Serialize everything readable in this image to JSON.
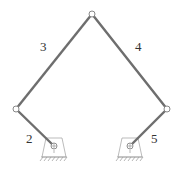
{
  "diagram": {
    "type": "five-bar linkage",
    "labels": {
      "link2": "2",
      "link3": "3",
      "link4": "4",
      "link5": "5"
    },
    "colors": {
      "link": "#6e6e6e",
      "joint_stroke": "#888888",
      "support_stroke": "#aaaaaa",
      "background": "#ffffff"
    },
    "joints": {
      "ground_left": [
        54,
        146
      ],
      "left": [
        16,
        109
      ],
      "top": [
        92,
        14
      ],
      "right": [
        167,
        109
      ],
      "ground_right": [
        130,
        146
      ]
    }
  }
}
